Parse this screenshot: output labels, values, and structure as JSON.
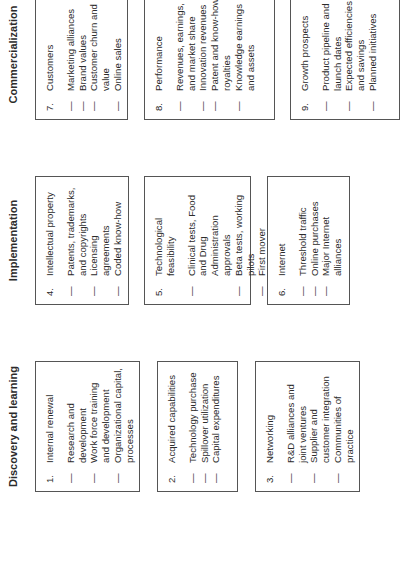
{
  "columns": [
    {
      "header": "Discovery and learning",
      "boxes": [
        {
          "number": "1.",
          "title": "Internal renewal",
          "items": [
            "Research and development",
            "Work force training and development",
            "Organizational capital, processes"
          ]
        },
        {
          "number": "2.",
          "title": "Acquired capabilities",
          "items": [
            "Technology purchase",
            "Spillover utilization",
            "Capital expenditures"
          ]
        },
        {
          "number": "3.",
          "title": "Networking",
          "items": [
            "R&D alliances and joint ventures",
            "Supplier and customer integration",
            "Communities of practice"
          ]
        }
      ]
    },
    {
      "header": "Implementation",
      "boxes": [
        {
          "number": "4.",
          "title": "Intellectual property",
          "items": [
            "Patents, trademarks, and copyrights",
            "Licensing agreements",
            "Coded know-how"
          ]
        },
        {
          "number": "5.",
          "title": "Technological feasibility",
          "items": [
            "Clinical tests, Food and Drug Administration approvals",
            "Beta tests, working pilots",
            "First mover"
          ]
        },
        {
          "number": "6.",
          "title": "Internet",
          "items": [
            "Threshold traffic",
            "Online purchases",
            "Major Internet alliances"
          ]
        }
      ]
    },
    {
      "header": "Commercialization",
      "boxes": [
        {
          "number": "7.",
          "title": "Customers",
          "items": [
            "Marketing alliances",
            "Brand values",
            "Customer churn and value",
            "Online sales"
          ]
        },
        {
          "number": "8.",
          "title": "Performance",
          "items": [
            "Revenues, earnings, and market share",
            "Innovation revenues",
            "Patent and know-how royalties",
            "Knowledge earnings and assets"
          ]
        },
        {
          "number": "9.",
          "title": "Growth prospects",
          "items": [
            "Product pipeline and launch dates",
            "Expected efficiencies and savings",
            "Planned initiatives"
          ]
        }
      ]
    }
  ],
  "dash_glyph": "—"
}
